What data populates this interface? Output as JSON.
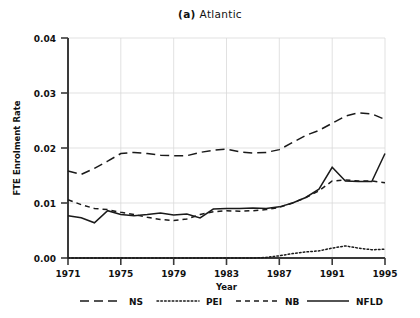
{
  "chart_data": {
    "type": "line",
    "title": "(a) Atlantic",
    "title_prefix": "(a)",
    "title_name": "Atlantic",
    "xlabel": "Year",
    "ylabel": "FTE Enrolment Rate",
    "grid": true,
    "legend_position": "bottom",
    "xlim": [
      1971,
      1995
    ],
    "ylim": [
      0.0,
      0.04
    ],
    "ytick_labels": [
      "0.04",
      "0.03",
      "0.02",
      "0.01",
      "0.00"
    ],
    "ytick_values": [
      0.04,
      0.03,
      0.02,
      0.01,
      0.0
    ],
    "xtick_labels": [
      "1971",
      "1975",
      "1979",
      "1983",
      "1987",
      "1991",
      "1995"
    ],
    "xtick_values": [
      1971,
      1975,
      1979,
      1983,
      1987,
      1991,
      1995
    ],
    "x": [
      1971,
      1972,
      1973,
      1974,
      1975,
      1976,
      1977,
      1978,
      1979,
      1980,
      1981,
      1982,
      1983,
      1984,
      1985,
      1986,
      1987,
      1988,
      1989,
      1990,
      1991,
      1992,
      1993,
      1994,
      1995
    ],
    "series": [
      {
        "name": "NS",
        "style": "long-dash",
        "values": [
          0.0158,
          0.0152,
          0.0163,
          0.0176,
          0.019,
          0.0192,
          0.019,
          0.0187,
          0.0186,
          0.0186,
          0.0192,
          0.0196,
          0.0198,
          0.0193,
          0.0191,
          0.0192,
          0.0197,
          0.021,
          0.0223,
          0.0232,
          0.0245,
          0.0258,
          0.0264,
          0.0262,
          0.0252
        ]
      },
      {
        "name": "PEI",
        "style": "dotted",
        "values": [
          0.0,
          0.0,
          0.0,
          0.0,
          0.0,
          0.0,
          0.0,
          0.0,
          0.0,
          0.0,
          0.0,
          0.0,
          0.0,
          0.0,
          0.0,
          0.0001,
          0.0004,
          0.0008,
          0.0011,
          0.0013,
          0.0018,
          0.0022,
          0.0018,
          0.0015,
          0.0016
        ]
      },
      {
        "name": "NB",
        "style": "dash",
        "values": [
          0.0106,
          0.0097,
          0.009,
          0.0088,
          0.0083,
          0.0079,
          0.0074,
          0.007,
          0.0068,
          0.0071,
          0.0079,
          0.0084,
          0.0086,
          0.0085,
          0.0086,
          0.0088,
          0.0092,
          0.01,
          0.011,
          0.0122,
          0.014,
          0.0142,
          0.014,
          0.014,
          0.0137
        ]
      },
      {
        "name": "NFLD",
        "style": "solid",
        "values": [
          0.0077,
          0.0073,
          0.0064,
          0.0086,
          0.0079,
          0.0077,
          0.0079,
          0.0082,
          0.0078,
          0.008,
          0.0073,
          0.0089,
          0.009,
          0.009,
          0.0091,
          0.009,
          0.0093,
          0.01,
          0.011,
          0.0125,
          0.0165,
          0.014,
          0.0139,
          0.0139,
          0.019
        ]
      }
    ],
    "legend": [
      {
        "label": "NS",
        "style": "long-dash"
      },
      {
        "label": "PEI",
        "style": "dotted"
      },
      {
        "label": "NB",
        "style": "dash"
      },
      {
        "label": "NFLD",
        "style": "solid"
      }
    ]
  }
}
